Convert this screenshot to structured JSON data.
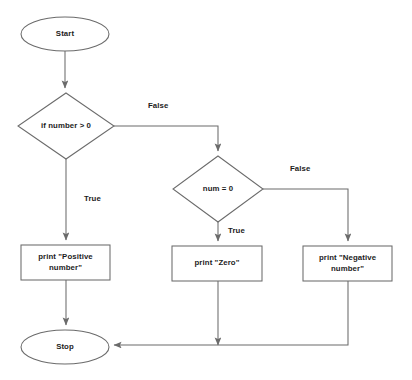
{
  "diagram": {
    "type": "flowchart",
    "theme": {
      "background": "#ffffff",
      "stroke": "#6b6b6b",
      "text": "#1c1c1c",
      "fill": "none"
    },
    "nodes": [
      {
        "id": "start",
        "shape": "ellipse",
        "label": "Start",
        "cx": 65,
        "cy": 34,
        "rx": 44,
        "ry": 17
      },
      {
        "id": "decision-positive",
        "shape": "diamond",
        "label": "if number > 0",
        "cx": 66,
        "cy": 126,
        "rx": 48,
        "ry": 33
      },
      {
        "id": "decision-zero",
        "shape": "diamond",
        "label": "num = 0",
        "cx": 218,
        "cy": 189,
        "rx": 45,
        "ry": 33
      },
      {
        "id": "print-positive",
        "shape": "rect",
        "label": "print \"Positive\nnumber\"",
        "x": 21,
        "y": 245,
        "w": 89,
        "h": 35
      },
      {
        "id": "print-zero",
        "shape": "rect",
        "label": "print \"Zero\"",
        "x": 172,
        "y": 246,
        "w": 90,
        "h": 35
      },
      {
        "id": "print-negative",
        "shape": "rect",
        "label": "print \"Negative\nnumber\"",
        "x": 303,
        "y": 246,
        "w": 89,
        "h": 35
      },
      {
        "id": "stop",
        "shape": "ellipse",
        "label": "Stop",
        "cx": 65,
        "cy": 347,
        "rx": 44,
        "ry": 17
      }
    ],
    "edge_labels": [
      {
        "id": "label-false-1",
        "text": "False",
        "x": 148,
        "y": 101
      },
      {
        "id": "label-true-1",
        "text": "True",
        "x": 84,
        "y": 194
      },
      {
        "id": "label-false-2",
        "text": "False",
        "x": 290,
        "y": 164
      },
      {
        "id": "label-true-2",
        "text": "True",
        "x": 228,
        "y": 226
      }
    ],
    "edges": [
      {
        "id": "edge-start-to-decision1",
        "from": "start",
        "to": "decision-positive",
        "label": ""
      },
      {
        "id": "edge-decision1-false",
        "from": "decision-positive",
        "to": "decision-zero",
        "label": "False"
      },
      {
        "id": "edge-decision1-true",
        "from": "decision-positive",
        "to": "print-positive",
        "label": "True"
      },
      {
        "id": "edge-decision2-false",
        "from": "decision-zero",
        "to": "print-negative",
        "label": "False"
      },
      {
        "id": "edge-decision2-true",
        "from": "decision-zero",
        "to": "print-zero",
        "label": "True"
      },
      {
        "id": "edge-positive-to-stop",
        "from": "print-positive",
        "to": "stop",
        "label": ""
      },
      {
        "id": "edge-zero-to-stop",
        "from": "print-zero",
        "to": "stop",
        "label": ""
      },
      {
        "id": "edge-negative-to-stop",
        "from": "print-negative",
        "to": "stop",
        "label": ""
      }
    ]
  }
}
